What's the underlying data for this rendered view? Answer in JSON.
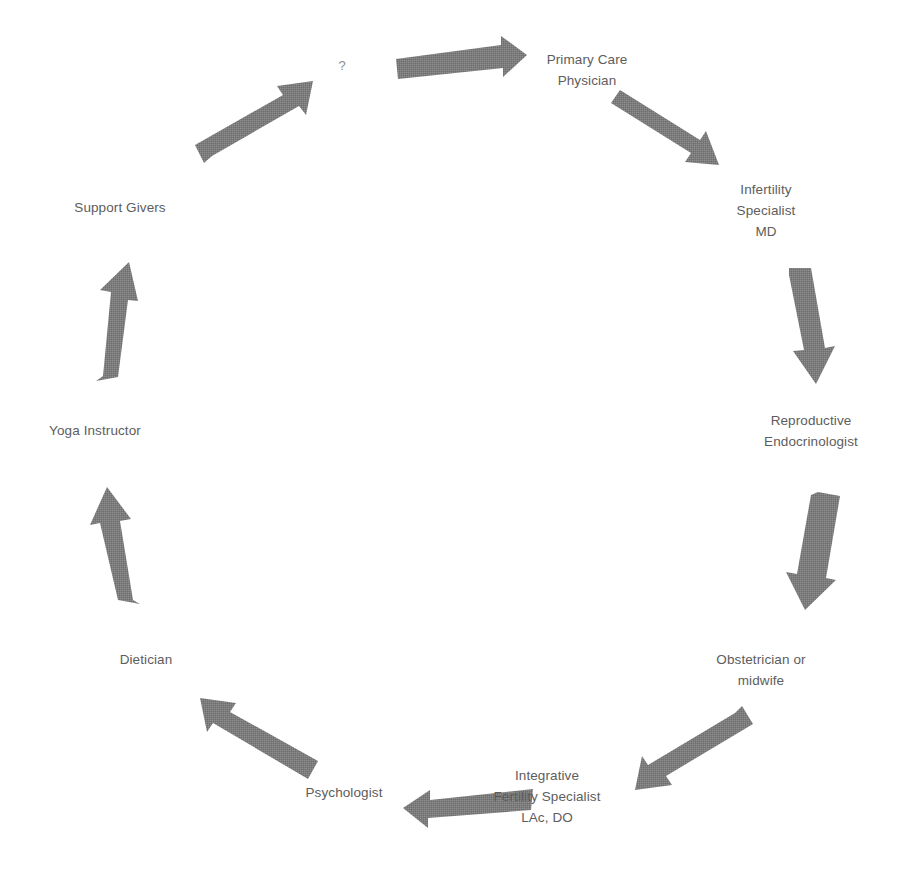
{
  "diagram": {
    "type": "cycle",
    "title": "",
    "arrow_color": "#7f7f7f",
    "text_color": "#5d5d5d",
    "background_color": "#ffffff",
    "question_mark": "?",
    "nodes": [
      {
        "id": "primary-care",
        "label": "Primary Care\nPhysician",
        "angle_deg": 90
      },
      {
        "id": "infertility",
        "label": "Infertility\nSpecialist\nMD",
        "angle_deg": 50
      },
      {
        "id": "reproductive",
        "label": "Reproductive\nEndocrinologist",
        "angle_deg": 10
      },
      {
        "id": "obstetrician",
        "label": "Obstetrician or\nmidwife",
        "angle_deg": -30
      },
      {
        "id": "integrative",
        "label": "Integrative\nFertility Specialist\nLAc, DO",
        "angle_deg": -70
      },
      {
        "id": "psychologist",
        "label": "Psychologist",
        "angle_deg": -110
      },
      {
        "id": "dietician",
        "label": "Dietician",
        "angle_deg": -150
      },
      {
        "id": "yoga",
        "label": "Yoga Instructor",
        "angle_deg": 170
      },
      {
        "id": "support",
        "label": "Support Givers",
        "angle_deg": 130
      }
    ],
    "arrows": [
      {
        "id": "arrow-to-primary-care",
        "from": "question-mark",
        "to": "primary-care",
        "direction": "right"
      },
      {
        "id": "arrow-to-infertility",
        "from": "primary-care",
        "to": "infertility",
        "direction": "down-right"
      },
      {
        "id": "arrow-to-reproductive",
        "from": "infertility",
        "to": "reproductive",
        "direction": "down"
      },
      {
        "id": "arrow-to-obstetrician",
        "from": "reproductive",
        "to": "obstetrician",
        "direction": "down"
      },
      {
        "id": "arrow-to-integrative",
        "from": "obstetrician",
        "to": "integrative",
        "direction": "down-left"
      },
      {
        "id": "arrow-to-psychologist",
        "from": "integrative",
        "to": "psychologist",
        "direction": "left"
      },
      {
        "id": "arrow-to-dietician",
        "from": "psychologist",
        "to": "dietician",
        "direction": "up-left"
      },
      {
        "id": "arrow-to-yoga",
        "from": "dietician",
        "to": "yoga",
        "direction": "up"
      },
      {
        "id": "arrow-to-support",
        "from": "yoga",
        "to": "support",
        "direction": "up"
      },
      {
        "id": "arrow-to-question",
        "from": "support",
        "to": "question-mark",
        "direction": "up-right"
      }
    ]
  }
}
